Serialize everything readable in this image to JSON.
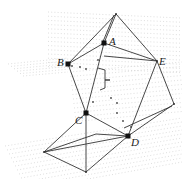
{
  "figure": {
    "vertices": [
      {
        "id": "apex",
        "label": ""
      },
      {
        "id": "A",
        "label": "A"
      },
      {
        "id": "B",
        "label": "B"
      },
      {
        "id": "E",
        "label": "E"
      },
      {
        "id": "C",
        "label": "C"
      },
      {
        "id": "D",
        "label": "D"
      },
      {
        "id": "right",
        "label": ""
      },
      {
        "id": "left-low",
        "label": ""
      },
      {
        "id": "bottom",
        "label": ""
      }
    ],
    "labels": {
      "A": "A",
      "B": "B",
      "C": "C",
      "D": "D",
      "E": "E"
    },
    "edges": [
      [
        "apex",
        "A"
      ],
      [
        "apex",
        "B"
      ],
      [
        "apex",
        "E"
      ],
      [
        "A",
        "B"
      ],
      [
        "A",
        "E"
      ],
      [
        "B",
        "C"
      ],
      [
        "E",
        "D"
      ],
      [
        "C",
        "D"
      ],
      [
        "E",
        "right"
      ],
      [
        "right",
        "D"
      ],
      [
        "C",
        "bottom"
      ],
      [
        "left-low",
        "bottom"
      ],
      [
        "left-low",
        "D"
      ],
      [
        "bottom",
        "D"
      ],
      [
        "A",
        "C"
      ]
    ],
    "colors": {
      "edge": "#333333",
      "dotted_plane": "#c8c8c8",
      "marker": "#111111"
    }
  }
}
